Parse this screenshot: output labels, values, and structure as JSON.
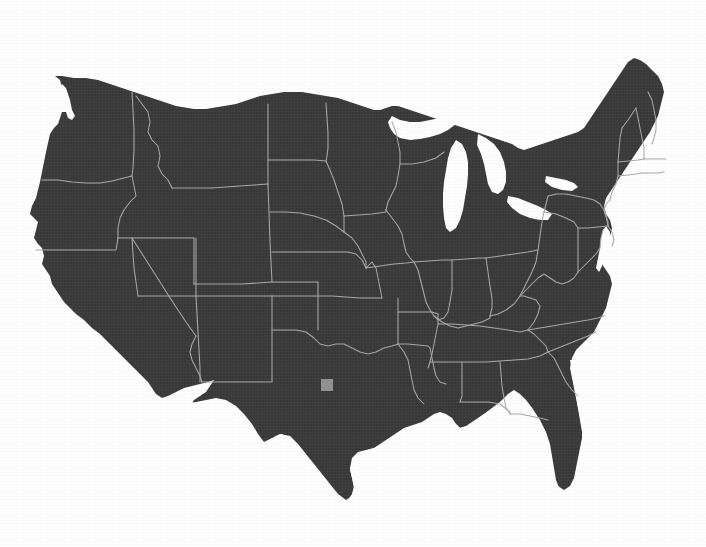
{
  "map": {
    "title": "Contiguous United States",
    "projection": "albers-usa",
    "land_color": "#3a3a3a",
    "border_color": "#a9a9a9",
    "background_color": "#ffffff",
    "marker_color": "#919191",
    "marker_label": "location-marker",
    "marker": {
      "x": 321,
      "y": 379,
      "width": 12,
      "height": 12,
      "region": "Texas"
    },
    "states": [
      {
        "code": "WA",
        "name": "Washington"
      },
      {
        "code": "OR",
        "name": "Oregon"
      },
      {
        "code": "CA",
        "name": "California"
      },
      {
        "code": "NV",
        "name": "Nevada"
      },
      {
        "code": "ID",
        "name": "Idaho"
      },
      {
        "code": "MT",
        "name": "Montana"
      },
      {
        "code": "WY",
        "name": "Wyoming"
      },
      {
        "code": "UT",
        "name": "Utah"
      },
      {
        "code": "AZ",
        "name": "Arizona"
      },
      {
        "code": "CO",
        "name": "Colorado"
      },
      {
        "code": "NM",
        "name": "New Mexico"
      },
      {
        "code": "ND",
        "name": "North Dakota"
      },
      {
        "code": "SD",
        "name": "South Dakota"
      },
      {
        "code": "NE",
        "name": "Nebraska"
      },
      {
        "code": "KS",
        "name": "Kansas"
      },
      {
        "code": "OK",
        "name": "Oklahoma"
      },
      {
        "code": "TX",
        "name": "Texas"
      },
      {
        "code": "MN",
        "name": "Minnesota"
      },
      {
        "code": "IA",
        "name": "Iowa"
      },
      {
        "code": "MO",
        "name": "Missouri"
      },
      {
        "code": "AR",
        "name": "Arkansas"
      },
      {
        "code": "LA",
        "name": "Louisiana"
      },
      {
        "code": "WI",
        "name": "Wisconsin"
      },
      {
        "code": "IL",
        "name": "Illinois"
      },
      {
        "code": "MI",
        "name": "Michigan"
      },
      {
        "code": "IN",
        "name": "Indiana"
      },
      {
        "code": "OH",
        "name": "Ohio"
      },
      {
        "code": "KY",
        "name": "Kentucky"
      },
      {
        "code": "TN",
        "name": "Tennessee"
      },
      {
        "code": "MS",
        "name": "Mississippi"
      },
      {
        "code": "AL",
        "name": "Alabama"
      },
      {
        "code": "GA",
        "name": "Georgia"
      },
      {
        "code": "FL",
        "name": "Florida"
      },
      {
        "code": "SC",
        "name": "South Carolina"
      },
      {
        "code": "NC",
        "name": "North Carolina"
      },
      {
        "code": "VA",
        "name": "Virginia"
      },
      {
        "code": "WV",
        "name": "West Virginia"
      },
      {
        "code": "MD",
        "name": "Maryland"
      },
      {
        "code": "DE",
        "name": "Delaware"
      },
      {
        "code": "PA",
        "name": "Pennsylvania"
      },
      {
        "code": "NJ",
        "name": "New Jersey"
      },
      {
        "code": "NY",
        "name": "New York"
      },
      {
        "code": "CT",
        "name": "Connecticut"
      },
      {
        "code": "RI",
        "name": "Rhode Island"
      },
      {
        "code": "MA",
        "name": "Massachusetts"
      },
      {
        "code": "VT",
        "name": "Vermont"
      },
      {
        "code": "NH",
        "name": "New Hampshire"
      },
      {
        "code": "ME",
        "name": "Maine"
      }
    ],
    "water_features": [
      {
        "name": "Lake Superior"
      },
      {
        "name": "Lake Michigan"
      },
      {
        "name": "Lake Huron"
      },
      {
        "name": "Lake Erie"
      },
      {
        "name": "Lake Ontario"
      },
      {
        "name": "Chesapeake Bay"
      },
      {
        "name": "Gulf of Mexico"
      },
      {
        "name": "Atlantic Ocean"
      },
      {
        "name": "Pacific Ocean"
      }
    ]
  }
}
